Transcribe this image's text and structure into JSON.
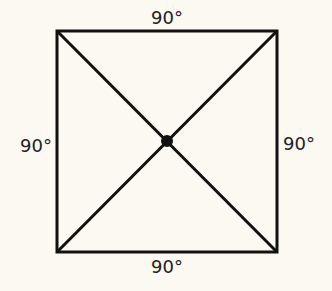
{
  "diagram": {
    "type": "square with diagonals",
    "labels": {
      "top": "90°",
      "left": "90°",
      "right": "90°",
      "bottom": "90°"
    },
    "colors": {
      "background": "#fbf9f1",
      "stroke": "#111111",
      "text": "#222222"
    }
  }
}
